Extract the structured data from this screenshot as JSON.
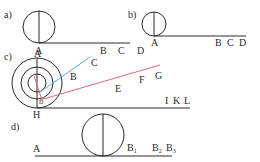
{
  "figure": {
    "panels": [
      {
        "id": "a",
        "label": "a)",
        "points": [
          "A",
          "B",
          "C",
          "D"
        ]
      },
      {
        "id": "b",
        "label": "b)",
        "points": [
          "A",
          "B",
          "C",
          "D"
        ]
      },
      {
        "id": "c",
        "label": "c)",
        "points": [
          "A",
          "B",
          "C",
          "D",
          "E",
          "F",
          "G",
          "H",
          "I",
          "K",
          "L"
        ]
      },
      {
        "id": "d",
        "label": "d)",
        "points": [
          "A",
          "B1",
          "B2",
          "B3"
        ],
        "point_base": [
          "A",
          "B",
          "B",
          "B"
        ],
        "point_sub": [
          "",
          "1",
          "2",
          "3"
        ]
      }
    ],
    "colors": {
      "line": "#2a2a2a",
      "blue": "#5aa6d6",
      "red": "#e06a7a"
    }
  }
}
